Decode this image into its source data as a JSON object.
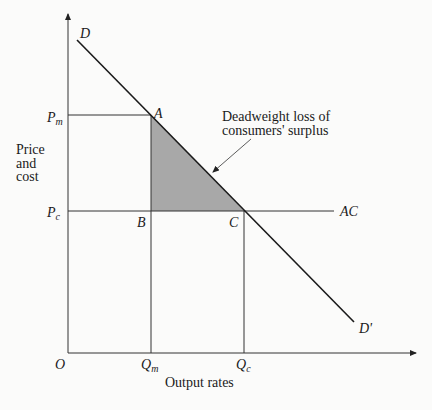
{
  "diagram": {
    "type": "monopoly deadweight loss diagram",
    "axes": {
      "y_label_lines": [
        "Price",
        "and",
        "cost"
      ],
      "x_label": "Output rates",
      "origin": "O"
    },
    "price_labels": {
      "pm": "P",
      "pm_sub": "m",
      "pc": "P",
      "pc_sub": "c"
    },
    "quantity_labels": {
      "qm": "Q",
      "qm_sub": "m",
      "qc": "Q",
      "qc_sub": "c"
    },
    "points": {
      "a": "A",
      "b": "B",
      "c": "C"
    },
    "curves": {
      "demand_start": "D",
      "demand_end": "D'",
      "average_cost": "AC"
    },
    "annotation": {
      "line1": "Deadweight loss of",
      "line2": "consumers' surplus"
    },
    "colors": {
      "shade": "#a8a8a8",
      "line": "#1a1a1a",
      "thin": "#333333"
    }
  }
}
